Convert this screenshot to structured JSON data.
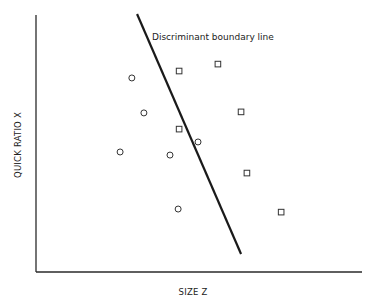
{
  "chart_data": {
    "type": "scatter",
    "title": "",
    "xlabel": "SIZE Z",
    "ylabel": "QUICK RATIO X",
    "xlim": [
      0,
      100
    ],
    "ylim": [
      0,
      100
    ],
    "grid": false,
    "legend": null,
    "tick_labels": {
      "x": [],
      "y": []
    },
    "series": [
      {
        "name": "Group A",
        "marker": "circle",
        "points": [
          {
            "x": 29.4,
            "y": 75.5
          },
          {
            "x": 33.1,
            "y": 61.9
          },
          {
            "x": 25.8,
            "y": 46.7
          },
          {
            "x": 41.1,
            "y": 45.5
          },
          {
            "x": 49.7,
            "y": 50.6
          },
          {
            "x": 43.6,
            "y": 24.5
          }
        ]
      },
      {
        "name": "Group B",
        "marker": "square",
        "points": [
          {
            "x": 43.9,
            "y": 78.2
          },
          {
            "x": 55.8,
            "y": 80.9
          },
          {
            "x": 62.9,
            "y": 62.3
          },
          {
            "x": 43.9,
            "y": 55.6
          },
          {
            "x": 64.7,
            "y": 38.5
          },
          {
            "x": 75.2,
            "y": 23.3
          }
        ]
      }
    ],
    "lines": [
      {
        "name": "Discriminant boundary line",
        "from": {
          "x": 31.0,
          "y": 100.4
        },
        "to": {
          "x": 62.9,
          "y": 7.0
        }
      }
    ],
    "annotations": [
      {
        "text": "Discriminant boundary line",
        "x": 35.6,
        "y": 91.5
      }
    ]
  },
  "labels": {
    "annotation": "Discriminant boundary line",
    "xlabel": "SIZE Z",
    "ylabel": "QUICK RATIO X"
  },
  "colors": {
    "ink": "#222222",
    "background": "#ffffff"
  }
}
